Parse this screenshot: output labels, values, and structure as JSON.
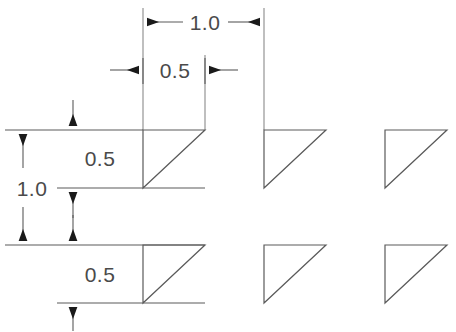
{
  "drawing": {
    "title": "Triangle array dimension drawing",
    "background_color": "#ffffff",
    "line_color": "#5a5a5a",
    "text_color": "#4a4a4a",
    "arrow_color": "#1a1a1a",
    "dimensions": [
      {
        "id": "pitch-x",
        "label": "1.0",
        "orientation": "horizontal",
        "x": 205,
        "y": 28
      },
      {
        "id": "width-x",
        "label": "0.5",
        "orientation": "horizontal",
        "x": 175,
        "y": 76
      },
      {
        "id": "pitch-y",
        "label": "1.0",
        "orientation": "vertical",
        "x": 32,
        "y": 195
      },
      {
        "id": "height-y-top",
        "label": "0.5",
        "orientation": "vertical",
        "x": 100,
        "y": 166
      },
      {
        "id": "height-y-bot",
        "label": "0.5",
        "orientation": "vertical",
        "x": 100,
        "y": 281
      }
    ],
    "shapes": {
      "type": "right-triangle",
      "right_angle_corner": "top-left",
      "rows": 2,
      "columns": 3,
      "leg_length": "0.5",
      "pitch": "1.0",
      "items": [
        {
          "row": 1,
          "col": 1,
          "x": 143,
          "y": 130,
          "w": 62,
          "h": 58
        },
        {
          "row": 1,
          "col": 2,
          "x": 264,
          "y": 130,
          "w": 62,
          "h": 58
        },
        {
          "row": 1,
          "col": 3,
          "x": 385,
          "y": 130,
          "w": 62,
          "h": 58
        },
        {
          "row": 2,
          "col": 1,
          "x": 143,
          "y": 245,
          "w": 62,
          "h": 58
        },
        {
          "row": 2,
          "col": 2,
          "x": 264,
          "y": 245,
          "w": 62,
          "h": 58
        },
        {
          "row": 2,
          "col": 3,
          "x": 385,
          "y": 245,
          "w": 62,
          "h": 58
        }
      ]
    }
  }
}
